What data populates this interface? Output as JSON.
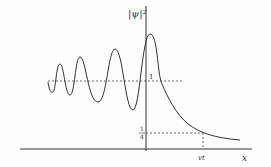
{
  "diagram": {
    "y_axis_label": "|ψ|²",
    "x_axis_label": "x",
    "level_one_label": "1",
    "level_quarter_numerator": "1",
    "level_quarter_denominator": "4",
    "vt_label": "vt"
  },
  "colors": {
    "line": "#333333",
    "background": "#fdfdfd"
  }
}
